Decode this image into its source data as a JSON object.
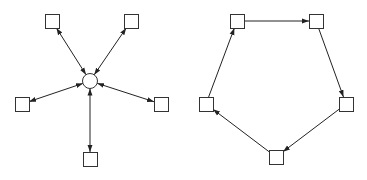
{
  "diagrams": [
    {
      "name": "star-topology",
      "hub": {
        "id": "hub",
        "shape": "circle",
        "cx": 90,
        "cy": 81,
        "r": 7.5
      },
      "nodes": [
        {
          "id": "n-top-left",
          "shape": "square",
          "x": 45,
          "y": 14,
          "size": 14
        },
        {
          "id": "n-top-right",
          "shape": "square",
          "x": 124,
          "y": 14,
          "size": 14
        },
        {
          "id": "n-left",
          "shape": "square",
          "x": 15,
          "y": 97,
          "size": 14
        },
        {
          "id": "n-right",
          "shape": "square",
          "x": 154,
          "y": 97,
          "size": 14
        },
        {
          "id": "n-bottom",
          "shape": "square",
          "x": 83,
          "y": 152,
          "size": 14
        }
      ],
      "edges": [
        {
          "from": "hub",
          "to": "n-top-left",
          "direction": "bidirectional"
        },
        {
          "from": "hub",
          "to": "n-top-right",
          "direction": "bidirectional"
        },
        {
          "from": "hub",
          "to": "n-left",
          "direction": "bidirectional"
        },
        {
          "from": "hub",
          "to": "n-right",
          "direction": "bidirectional"
        },
        {
          "from": "hub",
          "to": "n-bottom",
          "direction": "bidirectional"
        }
      ]
    },
    {
      "name": "ring-topology",
      "nodes": [
        {
          "id": "r-top-left",
          "shape": "square",
          "x": 230,
          "y": 14,
          "size": 14
        },
        {
          "id": "r-top-right",
          "shape": "square",
          "x": 309,
          "y": 14,
          "size": 14
        },
        {
          "id": "r-right",
          "shape": "square",
          "x": 339,
          "y": 97,
          "size": 14
        },
        {
          "id": "r-bottom",
          "shape": "square",
          "x": 269,
          "y": 150,
          "size": 14
        },
        {
          "id": "r-left",
          "shape": "square",
          "x": 199,
          "y": 97,
          "size": 14
        }
      ],
      "edges": [
        {
          "from": "r-top-left",
          "to": "r-top-right",
          "direction": "forward"
        },
        {
          "from": "r-top-right",
          "to": "r-right",
          "direction": "forward"
        },
        {
          "from": "r-right",
          "to": "r-bottom",
          "direction": "forward"
        },
        {
          "from": "r-bottom",
          "to": "r-left",
          "direction": "forward"
        },
        {
          "from": "r-left",
          "to": "r-top-left",
          "direction": "forward"
        }
      ]
    }
  ],
  "colors": {
    "stroke": "#222222",
    "node_stroke": "#333333",
    "background": "#ffffff"
  }
}
